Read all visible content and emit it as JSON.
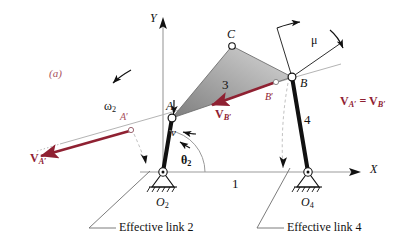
{
  "figure": {
    "caption": "(a)",
    "caption_color": "#a8505e",
    "accent_color": "#8f2132",
    "line_color": "#111111",
    "axis_color": "#8d8d8d",
    "link3_fill": "#9a9a9a",
    "type": "fourbar-linkage-effective-links-kinematics-diagram"
  },
  "axes": {
    "x_label": "X",
    "y_label": "Y",
    "origin_pivot": "O2"
  },
  "joints": [
    {
      "name": "A",
      "label": "A",
      "x": 172,
      "y": 118,
      "style": "open-circle"
    },
    {
      "name": "B",
      "label": "B",
      "x": 292,
      "y": 77,
      "style": "open-circle"
    },
    {
      "name": "C",
      "label": "C",
      "x": 232,
      "y": 46,
      "style": "open-circle"
    },
    {
      "name": "A-prime",
      "label": "A'",
      "x": 131,
      "y": 130,
      "style": "small-open-circle"
    },
    {
      "name": "B-prime",
      "label": "B'",
      "x": 275,
      "y": 82,
      "style": "small-open-circle"
    },
    {
      "name": "O2",
      "label": "O2",
      "x": 163,
      "y": 172,
      "style": "ground-pivot"
    },
    {
      "name": "O4",
      "label": "O4",
      "x": 308,
      "y": 172,
      "style": "ground-pivot"
    }
  ],
  "labels": {
    "caption": "(a)",
    "point_a": "A",
    "point_b": "B",
    "point_c": "C",
    "point_a_prime": "A",
    "point_a_prime_tick": "′",
    "point_b_prime": "B",
    "point_b_prime_tick": "′",
    "link1": "1",
    "link3": "3",
    "link4": "4",
    "omega2": "ω",
    "omega2_sub": "2",
    "theta2": "θ",
    "theta2_sub": "2",
    "mu": "μ",
    "v_small": "v",
    "o2": "O",
    "o2_sub": "2",
    "o4": "O",
    "o4_sub": "4",
    "x_axis": "X",
    "y_axis": "Y",
    "effective_link_2": "Effective link 2",
    "effective_link_4": "Effective link 4",
    "v_bold": "V",
    "vector_va_prime_sub": "A′",
    "vector_vb_prime_sub": "B′",
    "equation_lhs_sub": "A′",
    "equation_eq": " = ",
    "equation_rhs_sub": "B′"
  },
  "annotations": {
    "velocity_a_prime": "V A'",
    "velocity_b_prime": "V B'",
    "equality": "V A' = V B'",
    "transmission_angle": "μ"
  }
}
